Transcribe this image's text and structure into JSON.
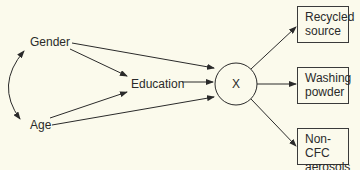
{
  "diagram": {
    "nodes": {
      "gender": "Gender",
      "age": "Age",
      "education": "Education",
      "x": "X",
      "recycled_l1": "Recycled",
      "recycled_l2": "source",
      "washing_l1": "Washing",
      "washing_l2": "powder",
      "noncfc_l1": "Non-CFC",
      "noncfc_l2": "aerosols"
    },
    "edges": [
      [
        "Gender",
        "Age",
        "bidirectional"
      ],
      [
        "Gender",
        "Education"
      ],
      [
        "Age",
        "Education"
      ],
      [
        "Gender",
        "X"
      ],
      [
        "Education",
        "X"
      ],
      [
        "Age",
        "X"
      ],
      [
        "X",
        "Recycled source"
      ],
      [
        "X",
        "Washing powder"
      ],
      [
        "X",
        "Non-CFC aerosols"
      ]
    ],
    "colors": {
      "background": "#fbfaec",
      "stroke": "#2a2a2a"
    }
  }
}
